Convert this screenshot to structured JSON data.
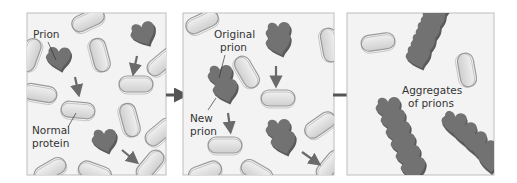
{
  "diagram": {
    "panels": [
      {
        "id": "panel-1",
        "labels": {
          "prion": "Prion",
          "normal_line1": "Normal",
          "normal_line2": "protein"
        }
      },
      {
        "id": "panel-2",
        "labels": {
          "original_line1": "Original",
          "original_line2": "prion",
          "new_line1": "New",
          "new_line2": "prion"
        }
      },
      {
        "id": "panel-3",
        "labels": {
          "aggregates_line1": "Aggregates",
          "aggregates_line2": "of prions"
        }
      }
    ],
    "colors": {
      "panel_bg": "#f3f3f3",
      "panel_border": "#bdbdbd",
      "normal_protein": "#e4e4e4",
      "normal_protein_edge": "#9a9a9a",
      "prion": "#6e6e6e",
      "prion_dark": "#4f4f4f",
      "arrow": "#6a6a6a",
      "big_arrow": "#555555"
    }
  }
}
